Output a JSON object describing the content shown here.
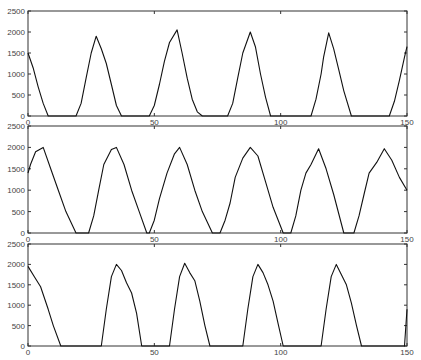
{
  "chart_data": [
    {
      "type": "line",
      "title": "",
      "xlabel": "",
      "ylabel": "",
      "xlim": [
        0,
        150
      ],
      "ylim": [
        0,
        2500
      ],
      "xticks": [
        0,
        50,
        100,
        150
      ],
      "xtick_labels": [
        "0",
        "50",
        "100",
        "150"
      ],
      "yticks": [
        0,
        500,
        1000,
        1500,
        2000,
        2500
      ],
      "ytick_labels": [
        "0",
        "500",
        "1000",
        "1500",
        "2000",
        "2500"
      ],
      "grid": false,
      "series": [
        {
          "name": "panel-1",
          "x": [
            0,
            2,
            4,
            6,
            8,
            19,
            21,
            23,
            25,
            27,
            29,
            31,
            33,
            35,
            37,
            48,
            50,
            52,
            54,
            56,
            59,
            61,
            63,
            65,
            67,
            69,
            79,
            81,
            83,
            85,
            88,
            90,
            92,
            94,
            96,
            112,
            114,
            116,
            117,
            119,
            121,
            123,
            125,
            128,
            143,
            145,
            147,
            149,
            150
          ],
          "y": [
            1500,
            1150,
            700,
            300,
            0,
            0,
            300,
            900,
            1500,
            1900,
            1600,
            1250,
            750,
            250,
            0,
            0,
            250,
            750,
            1300,
            1750,
            2050,
            1500,
            900,
            400,
            100,
            0,
            0,
            300,
            900,
            1500,
            2000,
            1650,
            1000,
            450,
            0,
            0,
            400,
            1000,
            1400,
            1980,
            1600,
            1100,
            600,
            0,
            0,
            350,
            850,
            1400,
            1650
          ]
        },
        {
          "name": "panel-2",
          "x": [
            0,
            1,
            3,
            6,
            9,
            12,
            15,
            19,
            24,
            26,
            28,
            30,
            33,
            35,
            38,
            41,
            44,
            47,
            48,
            50,
            52,
            55,
            58,
            60,
            63,
            66,
            69,
            73,
            76,
            78,
            80,
            82,
            85,
            88,
            91,
            94,
            97,
            101,
            104,
            106,
            108,
            110,
            112,
            115,
            118,
            121,
            125,
            129,
            131,
            133,
            135,
            138,
            141,
            144,
            147,
            150
          ],
          "y": [
            1400,
            1600,
            1900,
            2000,
            1500,
            1000,
            500,
            0,
            0,
            400,
            1000,
            1600,
            1950,
            2000,
            1600,
            1000,
            500,
            0,
            0,
            300,
            800,
            1400,
            1850,
            2000,
            1600,
            1000,
            500,
            0,
            0,
            300,
            700,
            1300,
            1750,
            2000,
            1800,
            1200,
            600,
            0,
            0,
            400,
            1000,
            1400,
            1600,
            1970,
            1500,
            900,
            0,
            0,
            400,
            900,
            1400,
            1650,
            1970,
            1700,
            1300,
            1000
          ]
        },
        {
          "name": "panel-3",
          "x": [
            0,
            3,
            5,
            8,
            10,
            13,
            29,
            31,
            33,
            35,
            37,
            39,
            41,
            43,
            45,
            56,
            58,
            60,
            62,
            64,
            66,
            68,
            70,
            72,
            85,
            87,
            89,
            91,
            93,
            95,
            97,
            99,
            101,
            116,
            118,
            120,
            122,
            124,
            126,
            128,
            130,
            132,
            149,
            150
          ],
          "y": [
            1950,
            1650,
            1450,
            900,
            500,
            0,
            0,
            900,
            1700,
            2000,
            1850,
            1550,
            1300,
            800,
            0,
            0,
            900,
            1700,
            2030,
            1800,
            1600,
            1100,
            500,
            0,
            0,
            900,
            1700,
            2000,
            1800,
            1500,
            1100,
            550,
            0,
            0,
            900,
            1700,
            2000,
            1750,
            1500,
            1050,
            500,
            0,
            0,
            900
          ]
        }
      ]
    }
  ]
}
